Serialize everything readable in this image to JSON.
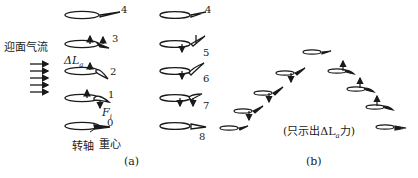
{
  "panel_a": {
    "caption": "(a)",
    "flow_label": "迎面气流",
    "delta_l_label": "ΔL",
    "delta_l_sub": "a",
    "force_label": "F",
    "force_sub": "i",
    "pivot_label": "转轴",
    "cg_label": "重心",
    "left_column_positions": [
      "4",
      "3",
      "2",
      "1",
      "0"
    ],
    "right_column_positions": [
      "4",
      "5",
      "6",
      "7",
      "8"
    ]
  },
  "panel_b": {
    "caption": "(b)",
    "note": "(只示出ΔL",
    "note_sub": "a",
    "note_end": "力)"
  },
  "colors": {
    "ink": "#1a1a1a",
    "background": "#ffffff"
  }
}
